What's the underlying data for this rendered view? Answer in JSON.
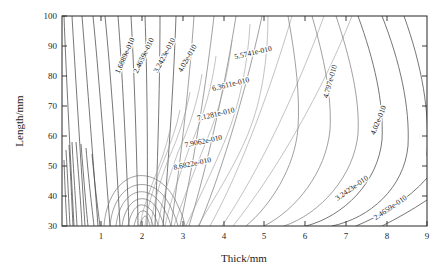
{
  "figure": {
    "background_color": "#ffffff",
    "line_color": "#6e6e6e",
    "axis_color": "#262626"
  },
  "chart_data": {
    "type": "contour",
    "title": "",
    "subtitle": "",
    "xlabel": "Thick/mm",
    "ylabel": "Length/mm",
    "xlim": [
      0.2,
      9
    ],
    "ylim": [
      30,
      100
    ],
    "xticks": [
      1,
      2,
      3,
      4,
      5,
      6,
      7,
      8,
      9
    ],
    "xtick_labels": [
      "1",
      "2",
      "3",
      "4",
      "5",
      "6",
      "7",
      "8",
      "9"
    ],
    "yticks": [
      30,
      40,
      50,
      60,
      70,
      80,
      90,
      100
    ],
    "ytick_labels": [
      "30",
      "40",
      "50",
      "60",
      "70",
      "80",
      "90",
      "100"
    ],
    "grid": false,
    "legend": false,
    "legend_position": "none",
    "colorbar": false,
    "level_step": 7.77e-11,
    "level_unit": "",
    "labeled_levels": [
      {
        "id": "lvl-1",
        "value": 1.6889e-10,
        "label": "1.6889e-010",
        "x": 1.77,
        "y": 86.5,
        "rotation": -66
      },
      {
        "id": "lvl-2",
        "value": 2.4659e-10,
        "label": "2.4659e-010",
        "x": 2.22,
        "y": 86.5,
        "rotation": -64
      },
      {
        "id": "lvl-3",
        "value": 3.2423e-10,
        "label": "3.2423e-010",
        "x": 2.72,
        "y": 86.5,
        "rotation": -62
      },
      {
        "id": "lvl-4",
        "value": 4.02e-10,
        "label": "4.02e-010",
        "x": 3.27,
        "y": 85.5,
        "rotation": -60
      },
      {
        "id": "lvl-5",
        "value": 5.5741e-10,
        "label": "5.5741e-010",
        "x": 4.82,
        "y": 87.0,
        "rotation": -13
      },
      {
        "id": "lvl-6",
        "value": 6.3611e-10,
        "label": "6.3611e-010",
        "x": 4.28,
        "y": 76.5,
        "rotation": -14
      },
      {
        "id": "lvl-7",
        "value": 7.1281e-10,
        "label": "7.1281e-010",
        "x": 3.92,
        "y": 66.5,
        "rotation": -13
      },
      {
        "id": "lvl-8",
        "value": 7.9062e-10,
        "label": "7.9062e-010",
        "x": 3.62,
        "y": 57.5,
        "rotation": -12
      },
      {
        "id": "lvl-9",
        "value": 8.6822e-10,
        "label": "8.6822e-010",
        "x": 3.35,
        "y": 50.0,
        "rotation": -12
      },
      {
        "id": "lvl-10",
        "value": 4.797e-10,
        "label": "4.797e-010",
        "x": 6.72,
        "y": 78.0,
        "rotation": -74
      },
      {
        "id": "lvl-11",
        "value": 4.02e-10,
        "label": "4.02e-010",
        "x": 7.88,
        "y": 65.0,
        "rotation": -68
      },
      {
        "id": "lvl-12",
        "value": 3.2423e-10,
        "label": "3.2423e-010",
        "x": 7.22,
        "y": 42.0,
        "rotation": -35
      },
      {
        "id": "lvl-13",
        "value": 2.4659e-10,
        "label": "2.4659e-010",
        "x": 8.15,
        "y": 35.5,
        "rotation": -34
      }
    ]
  }
}
